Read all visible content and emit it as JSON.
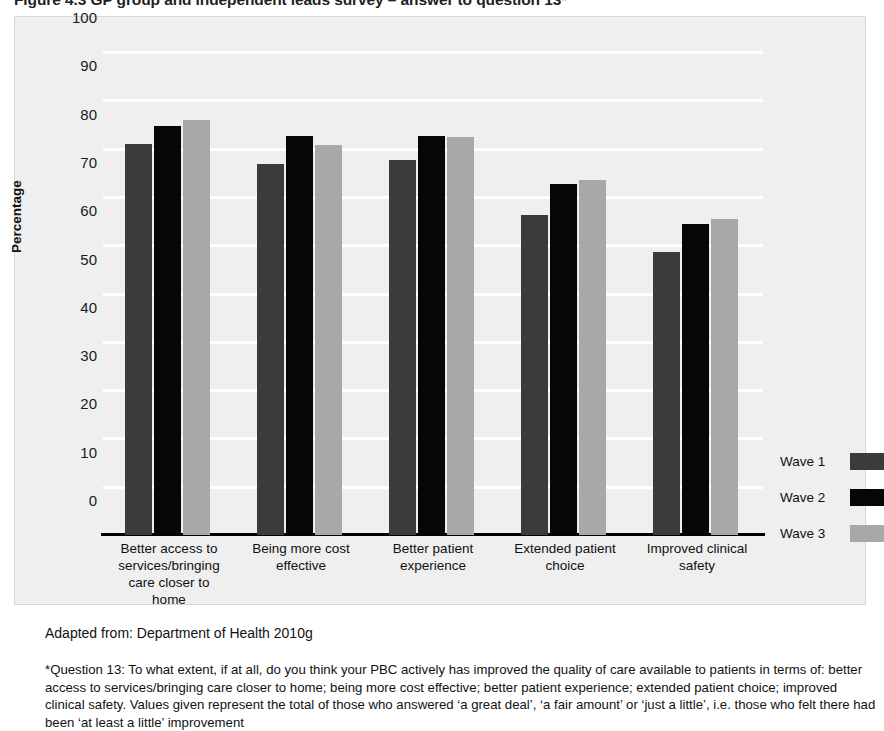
{
  "caption": "Figure 4.3  GP group and independent leads survey – answer to question 13*",
  "figure": {
    "background_color": "#efefef",
    "plot_background": "#efefef",
    "gridline_color": "#ffffff",
    "axis_color": "#000000"
  },
  "axis": {
    "y_title": "Percentage",
    "y_ticks": [
      "100",
      "90",
      "80",
      "70",
      "60",
      "50",
      "40",
      "30",
      "20",
      "10",
      "0"
    ]
  },
  "legend": {
    "position": "right",
    "entries": [
      {
        "label": "Wave 1",
        "color": "#3b3b3b"
      },
      {
        "label": "Wave 2",
        "color": "#060606"
      },
      {
        "label": "Wave 3",
        "color": "#a8a8a8"
      }
    ]
  },
  "footnotes": {
    "source": "Adapted from: Department of Health 2010g",
    "note": "*Question 13: To what extent, if at all, do you think your PBC actively has improved the quality of care available to patients in terms of: better access to services/bringing care closer to home; being more cost effective; better patient experience; extended patient choice; improved clinical safety. Values given represent the total of those who answered ‘a great deal’, ‘a fair amount’ or ‘just a little’, i.e. those who felt there had been ‘at least a little’ improvement"
  },
  "chart_data": {
    "type": "bar",
    "title": "GP group and independent leads survey – answer to question 13",
    "xlabel": "",
    "ylabel": "Percentage",
    "ylim": [
      0,
      100
    ],
    "ytick_step": 10,
    "grid": true,
    "legend_position": "right",
    "categories": [
      "Better access to services/bringing care closer to home",
      "Being more cost effective",
      "Better patient experience",
      "Extended patient choice",
      "Improved clinical safety"
    ],
    "category_lines": [
      [
        "Better access to",
        "services/bringing",
        "care closer to",
        "home"
      ],
      [
        "Being more cost",
        "effective"
      ],
      [
        "Better patient",
        "experience"
      ],
      [
        "Extended patient",
        "choice"
      ],
      [
        "Improved clinical",
        "safety"
      ]
    ],
    "series": [
      {
        "name": "Wave 1",
        "color": "#3b3b3b",
        "values": [
          81,
          76.8,
          77.6,
          66.3,
          58.5
        ]
      },
      {
        "name": "Wave 2",
        "color": "#060606",
        "values": [
          84.7,
          82.7,
          82.7,
          72.7,
          64.4
        ]
      },
      {
        "name": "Wave 3",
        "color": "#a8a8a8",
        "values": [
          85.9,
          80.8,
          82.5,
          73.4,
          65.4
        ]
      }
    ]
  }
}
